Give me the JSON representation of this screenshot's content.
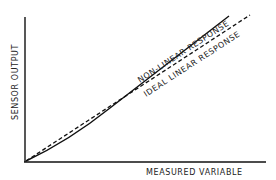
{
  "diagram": {
    "y_axis_label": "SENSOR OUTPUT",
    "x_axis_label": "MEASURED VARIABLE",
    "curves": [
      {
        "name": "non-linear-response",
        "label": "NON-LINEAR RESPONSE",
        "style": "solid"
      },
      {
        "name": "ideal-linear-response",
        "label": "IDEAL LINEAR RESPONSE",
        "style": "dashed"
      }
    ],
    "colors": {
      "line": "#111111",
      "background": "#ffffff"
    }
  }
}
